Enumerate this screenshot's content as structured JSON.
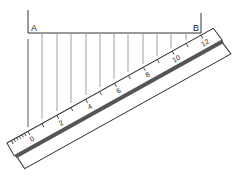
{
  "diagram": {
    "points": {
      "a": "A",
      "b": "B"
    },
    "scale_labels": [
      "0",
      "2",
      "4",
      "6",
      "8",
      "10",
      "12"
    ],
    "divisions": 12,
    "colors": {
      "line": "#444444",
      "stripe": "#555555",
      "ruler_fill": "#ffffff"
    }
  }
}
